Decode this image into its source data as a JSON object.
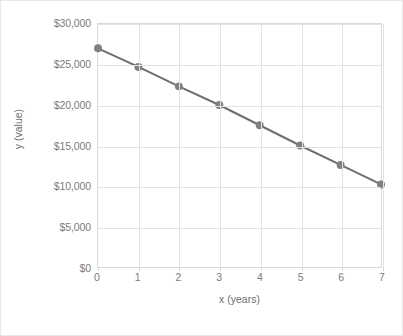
{
  "chart_data": {
    "type": "line",
    "title": "",
    "xlabel": "x (years)",
    "ylabel": "y (value)",
    "x": [
      0,
      1,
      2,
      3,
      4,
      5,
      6,
      7
    ],
    "values": [
      27000,
      24700,
      22300,
      20000,
      17500,
      15000,
      12600,
      10200
    ],
    "series": [
      {
        "name": "value",
        "values": [
          27000,
          24700,
          22300,
          20000,
          17500,
          15000,
          12600,
          10200
        ]
      }
    ],
    "xlim": [
      0,
      7
    ],
    "ylim": [
      0,
      30000
    ],
    "xtick_labels": [
      "0",
      "1",
      "2",
      "3",
      "4",
      "5",
      "6",
      "7"
    ],
    "ytick_values": [
      0,
      5000,
      10000,
      15000,
      20000,
      25000,
      30000
    ],
    "ytick_labels": [
      "$0",
      "$5,000",
      "$10,000",
      "$15,000",
      "$20,000",
      "$25,000",
      "$30,000"
    ],
    "grid": true,
    "legend": "none",
    "line_color": "#6e6e6e",
    "marker_color": "#808080",
    "grid_color": "#e3e3e3",
    "axis_color": "#d9d9d9",
    "text_color": "#7b7b7b",
    "background": "#ffffff"
  }
}
